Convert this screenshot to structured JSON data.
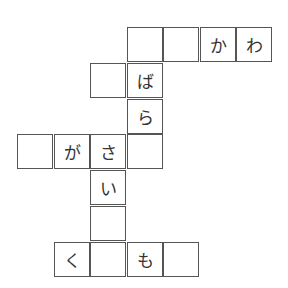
{
  "puzzle": {
    "type": "crossword-grid",
    "origin": {
      "x": 17,
      "y": 27
    },
    "cell_w": 36.5,
    "cell_h": 35.8,
    "colors": {
      "border": "#555555",
      "text": "#333333",
      "background": "#ffffff"
    },
    "cells": [
      {
        "row": 0,
        "col": 3,
        "char": ""
      },
      {
        "row": 0,
        "col": 4,
        "char": ""
      },
      {
        "row": 0,
        "col": 5,
        "char": "か"
      },
      {
        "row": 0,
        "col": 6,
        "char": "わ"
      },
      {
        "row": 1,
        "col": 2,
        "char": ""
      },
      {
        "row": 1,
        "col": 3,
        "char": "ば"
      },
      {
        "row": 2,
        "col": 3,
        "char": "ら"
      },
      {
        "row": 3,
        "col": 0,
        "char": ""
      },
      {
        "row": 3,
        "col": 1,
        "char": "が"
      },
      {
        "row": 3,
        "col": 2,
        "char": "さ"
      },
      {
        "row": 3,
        "col": 3,
        "char": ""
      },
      {
        "row": 4,
        "col": 2,
        "char": "い"
      },
      {
        "row": 5,
        "col": 2,
        "char": ""
      },
      {
        "row": 6,
        "col": 1,
        "char": "く"
      },
      {
        "row": 6,
        "col": 2,
        "char": ""
      },
      {
        "row": 6,
        "col": 3,
        "char": "も"
      },
      {
        "row": 6,
        "col": 4,
        "char": ""
      }
    ]
  }
}
